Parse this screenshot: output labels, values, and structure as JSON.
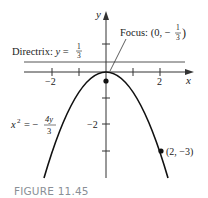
{
  "figure": {
    "caption": "FIGURE 11.45",
    "axes": {
      "x_label": "x",
      "y_label": "y",
      "x_ticks": [
        -2,
        -1,
        0,
        1,
        2
      ],
      "y_ticks": [
        1,
        -1,
        -2,
        -3
      ],
      "x_tick_labels": {
        "neg2": "−2",
        "pos2": "2"
      },
      "y_tick_labels": {
        "neg2": "−2"
      }
    },
    "parabola": {
      "equation_lhs": "x",
      "equation_exp": "2",
      "equation_eq": "= −",
      "equation_num": "4y",
      "equation_den": "3"
    },
    "directrix": {
      "label_prefix": "Directrix: ",
      "label_var": "y",
      "label_eq": " = ",
      "frac_num": "1",
      "frac_den": "3"
    },
    "focus": {
      "label_prefix": "Focus: ",
      "open": "(0, −",
      "frac_num": "1",
      "frac_den": "3",
      "close": ")"
    },
    "point": {
      "label": "(2, −3)"
    },
    "colors": {
      "curve": "#111111",
      "axis": "#333333",
      "directrix": "#555555",
      "caption": "#8a8f96"
    }
  }
}
